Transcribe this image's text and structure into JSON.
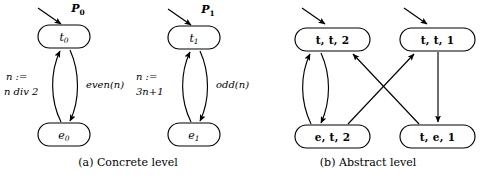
{
  "figure": {
    "panels": [
      {
        "id": "concrete",
        "caption": "(a) Concrete level",
        "machines": [
          {
            "id": "machine-0",
            "init_label_main": "P",
            "init_label_sub": "0",
            "top_node": {
              "main": "t",
              "sub": "0"
            },
            "bottom_node": {
              "main": "e",
              "sub": "0"
            },
            "left_edge_label_line1": "n :=",
            "left_edge_label_line2": "n div 2",
            "right_edge_label": "even(n)"
          },
          {
            "id": "machine-1",
            "init_label_main": "P",
            "init_label_sub": "1",
            "top_node": {
              "main": "t",
              "sub": "1"
            },
            "bottom_node": {
              "main": "e",
              "sub": "1"
            },
            "left_edge_label_line1": "n :=",
            "left_edge_label_line2": "3n+1",
            "right_edge_label": "odd(n)"
          }
        ]
      },
      {
        "id": "abstract",
        "caption": "(b) Abstract level",
        "nodes": [
          {
            "id": "tt2",
            "label": "t, t, 2"
          },
          {
            "id": "tt1",
            "label": "t, t, 1"
          },
          {
            "id": "et2",
            "label": "e, t, 2"
          },
          {
            "id": "te1",
            "label": "t, e, 1"
          }
        ]
      }
    ]
  },
  "colors": {
    "ink": "#000000",
    "paper": "#ffffff"
  }
}
